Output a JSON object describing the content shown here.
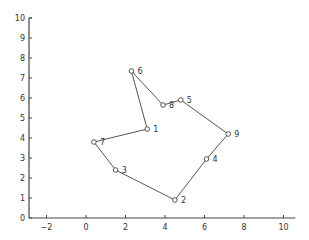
{
  "chart_data": {
    "type": "line",
    "title": "",
    "xlabel": "",
    "ylabel": "",
    "xlim": [
      -2.9,
      10.6
    ],
    "ylim": [
      0,
      10
    ],
    "xticks": [
      -2,
      0,
      2,
      4,
      6,
      8,
      10
    ],
    "yticks": [
      0,
      1,
      2,
      3,
      4,
      5,
      6,
      7,
      8,
      9,
      10
    ],
    "grid": false,
    "legend": null,
    "points": [
      {
        "label": "1",
        "x": 3.1,
        "y": 4.45
      },
      {
        "label": "2",
        "x": 4.5,
        "y": 0.9
      },
      {
        "label": "3",
        "x": 1.5,
        "y": 2.4
      },
      {
        "label": "4",
        "x": 6.1,
        "y": 2.95
      },
      {
        "label": "5",
        "x": 4.8,
        "y": 5.9
      },
      {
        "label": "6",
        "x": 2.3,
        "y": 7.35
      },
      {
        "label": "7",
        "x": 0.4,
        "y": 3.8
      },
      {
        "label": "8",
        "x": 3.9,
        "y": 5.65
      },
      {
        "label": "9",
        "x": 7.2,
        "y": 4.2
      }
    ],
    "path_order": [
      "6",
      "1",
      "7",
      "3",
      "2",
      "4",
      "9",
      "5",
      "8",
      "6"
    ],
    "line_color": "#555555",
    "marker": "circle-open"
  }
}
